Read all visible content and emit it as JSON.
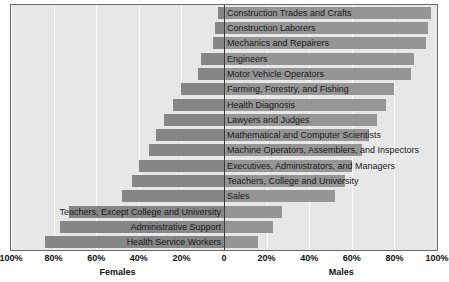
{
  "chart_data": {
    "type": "bar",
    "title": "",
    "subtitle": "",
    "orientation": "horizontal-diverging",
    "xlabel": "",
    "ylabel": "",
    "xlim": [
      -100,
      100
    ],
    "grid": true,
    "legend_position": "none",
    "left_axis_title": "Females",
    "right_axis_title": "Males",
    "tick_labels_left": [
      "100%",
      "80%",
      "60%",
      "40%",
      "20%",
      "0"
    ],
    "tick_labels_right": [
      "20%",
      "40%",
      "60%",
      "80%",
      "100%"
    ],
    "tick_values": [
      -100,
      -80,
      -60,
      -40,
      -20,
      0,
      20,
      40,
      60,
      80,
      100
    ],
    "categories": [
      "Construction Trades and Crafts",
      "Construction Laborers",
      "Mechanics and Repairers",
      "Engineers",
      "Motor Vehicle Operators",
      "Farming, Forestry, and Fishing",
      "Health Diagnosis",
      "Lawyers and Judges",
      "Mathematical and Computer Scientists",
      "Machine Operators, Assemblers, and Inspectors",
      "Executives, Administrators, and Managers",
      "Teachers, College and University",
      "Sales",
      "Teachers, Except College and University",
      "Administrative Support",
      "Health Service Workers"
    ],
    "series": [
      {
        "name": "Males",
        "values": [
          97,
          96,
          95,
          89,
          88,
          80,
          76,
          72,
          68,
          65,
          60,
          57,
          52,
          27,
          23,
          16
        ]
      },
      {
        "name": "Females",
        "values": [
          3,
          4,
          5,
          11,
          12,
          20,
          24,
          28,
          32,
          35,
          40,
          43,
          48,
          73,
          77,
          84
        ]
      }
    ],
    "label_side": [
      "right",
      "right",
      "right",
      "right",
      "right",
      "right",
      "right",
      "right",
      "right",
      "right",
      "right",
      "right",
      "right",
      "left",
      "left",
      "left"
    ]
  },
  "colors": {
    "plot_background": "#e7e7e7",
    "gridline": "#fbfbfb",
    "zeroline": "#3a3a3a",
    "bar_female": "#868686",
    "bar_male": "#959595",
    "frame": "#6b6b6b",
    "text": "#111111",
    "page_background": "#ffffff"
  }
}
